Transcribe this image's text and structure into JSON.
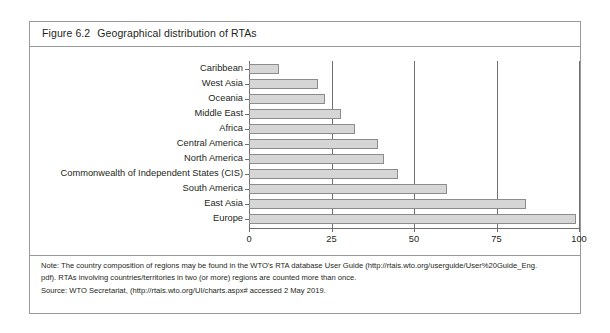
{
  "figure": {
    "number": "Figure 6.2",
    "title": "Geographical distribution of RTAs"
  },
  "chart_data": {
    "type": "bar",
    "orientation": "horizontal",
    "title": "Geographical distribution of RTAs",
    "xlabel": "",
    "ylabel": "",
    "xlim": [
      0,
      100
    ],
    "xticks": [
      "0",
      "25",
      "50",
      "75",
      "100"
    ],
    "grid": "vertical",
    "legend": "none",
    "bar_color": "#d6d6d6",
    "bar_border_color": "#8c8c8c",
    "categories": [
      "Caribbean",
      "West Asia",
      "Oceania",
      "Middle East",
      "Africa",
      "Central America",
      "North America",
      "Commonwealth of Independent States (CIS)",
      "South America",
      "East Asia",
      "Europe"
    ],
    "values": [
      9,
      21,
      23,
      28,
      32,
      39,
      41,
      45,
      60,
      84,
      99
    ]
  },
  "notes": {
    "line1": "Note: The country composition of regions may be found in the WTO's RTA database User Guide (http://rtais.wto.org/userguide/User%20Guide_Eng.",
    "line2": "pdf). RTAs involving countries/territories in two (or more) regions are counted more than once.",
    "source": "Source: WTO Secretariat, (http://rtais.wto.org/UI/charts.aspx# accessed 2 May 2019."
  }
}
